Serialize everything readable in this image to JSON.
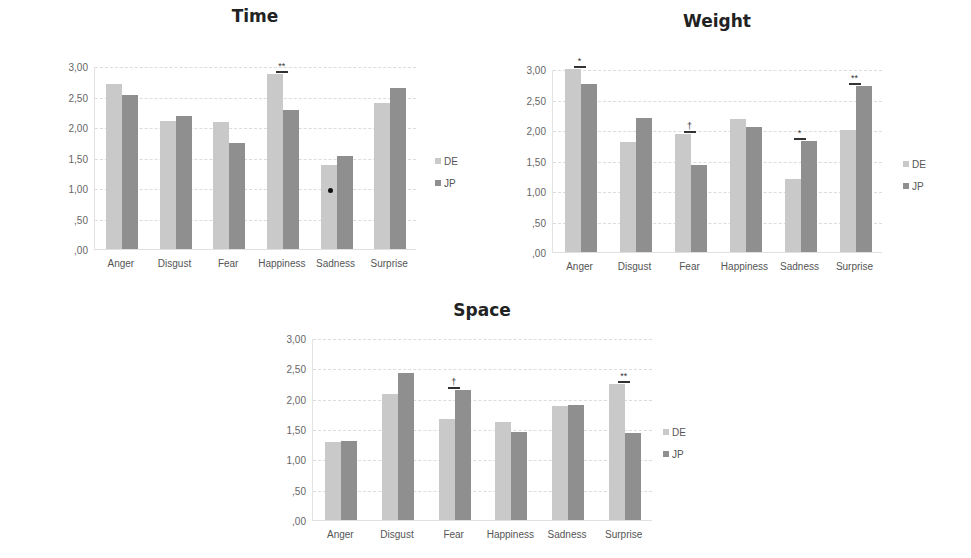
{
  "legend": {
    "series": [
      {
        "name": "DE",
        "color": "#c9c9c9"
      },
      {
        "name": "JP",
        "color": "#8f8f8f"
      }
    ]
  },
  "yticks": [
    "3,00",
    "2,50",
    "2,00",
    "1,50",
    "1,00",
    ",50",
    ",00"
  ],
  "chart_data": [
    {
      "type": "bar",
      "title": "Time",
      "categories": [
        "Anger",
        "Disgust",
        "Fear",
        "Happiness",
        "Sadness",
        "Surprise"
      ],
      "series": [
        {
          "name": "DE",
          "values": [
            2.7,
            2.1,
            2.08,
            2.87,
            1.38,
            2.39
          ]
        },
        {
          "name": "JP",
          "values": [
            2.53,
            2.18,
            1.74,
            2.28,
            1.53,
            2.64
          ]
        }
      ],
      "significance": [
        {
          "category": "Happiness",
          "marker": "**"
        }
      ],
      "xlabel": "",
      "ylabel": "",
      "ylim": [
        0,
        3
      ],
      "grid": true,
      "legend_position": "right"
    },
    {
      "type": "bar",
      "title": "Weight",
      "categories": [
        "Anger",
        "Disgust",
        "Fear",
        "Happiness",
        "Sadness",
        "Surprise"
      ],
      "series": [
        {
          "name": "DE",
          "values": [
            3.0,
            1.8,
            1.93,
            2.18,
            1.2,
            2.0
          ]
        },
        {
          "name": "JP",
          "values": [
            2.75,
            2.2,
            1.43,
            2.05,
            1.82,
            2.72
          ]
        }
      ],
      "significance": [
        {
          "category": "Anger",
          "marker": "*"
        },
        {
          "category": "Fear",
          "marker": "†"
        },
        {
          "category": "Sadness",
          "marker": "*"
        },
        {
          "category": "Surprise",
          "marker": "**"
        }
      ],
      "xlabel": "",
      "ylabel": "",
      "ylim": [
        0,
        3
      ],
      "grid": true,
      "legend_position": "right"
    },
    {
      "type": "bar",
      "title": "Space",
      "categories": [
        "Anger",
        "Disgust",
        "Fear",
        "Happiness",
        "Sadness",
        "Surprise"
      ],
      "series": [
        {
          "name": "DE",
          "values": [
            1.28,
            2.07,
            1.67,
            1.62,
            1.88,
            2.25
          ]
        },
        {
          "name": "JP",
          "values": [
            1.31,
            2.43,
            2.14,
            1.45,
            1.9,
            1.44
          ]
        }
      ],
      "significance": [
        {
          "category": "Fear",
          "marker": "†"
        },
        {
          "category": "Surprise",
          "marker": "**"
        }
      ],
      "xlabel": "",
      "ylabel": "",
      "ylim": [
        0,
        3
      ],
      "grid": true,
      "legend_position": "right"
    }
  ]
}
